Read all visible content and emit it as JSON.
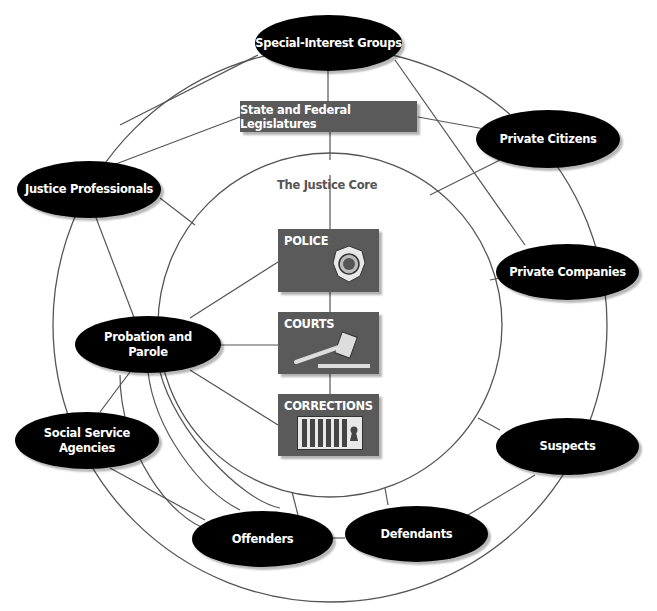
{
  "diagram": {
    "type": "relationship-diagram",
    "colors": {
      "node_fill": "#000000",
      "node_text": "#ffffff",
      "box_fill": "#5a5a5a",
      "line": "#555555",
      "core_label": "#555555",
      "ring_fill": "#ffffff"
    },
    "legislatures_label": "State and Federal Legislatures",
    "core_label": "The Justice Core",
    "core_boxes": {
      "police": {
        "label": "POLICE",
        "icon": "police-badge-icon"
      },
      "courts": {
        "label": "COURTS",
        "icon": "gavel-icon"
      },
      "corrections": {
        "label": "CORRECTIONS",
        "icon": "jail-cell-icon"
      }
    },
    "nodes": {
      "special_interest": "Special-Interest Groups",
      "private_citizens": "Private Citizens",
      "justice_professionals": "Justice Professionals",
      "private_companies": "Private Companies",
      "probation_line1": "Probation and",
      "probation_line2": "Parole",
      "social_service": "Social Service Agencies",
      "suspects": "Suspects",
      "offenders": "Offenders",
      "defendants": "Defendants"
    }
  }
}
